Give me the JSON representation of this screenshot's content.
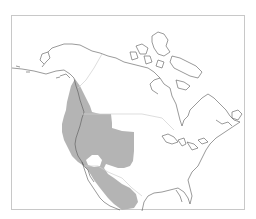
{
  "map": {
    "title": "North America range map",
    "region": "North America",
    "colors": {
      "background": "#ffffff",
      "frame": "#c8c8c8",
      "coastline": "#555555",
      "borders": "#d0d0d0",
      "range_fill": "#b4b4b4"
    },
    "layers": [
      {
        "name": "coastline",
        "label": "Coastlines"
      },
      {
        "name": "political-borders",
        "label": "Country boundaries"
      },
      {
        "name": "range",
        "label": "Distribution range"
      }
    ],
    "range_description": "Western North America: Pacific coast from southeast Alaska through British Columbia, western United States, Baja California and northwestern/central Mexico"
  }
}
